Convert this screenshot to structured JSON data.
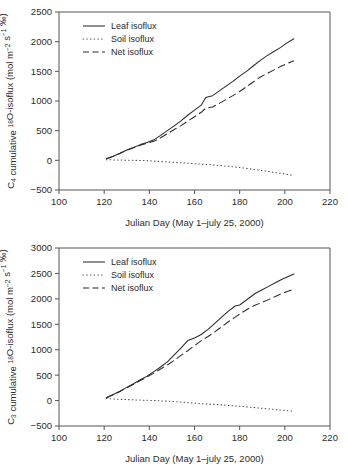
{
  "figure": {
    "panels": [
      "top",
      "bottom"
    ]
  },
  "chart_data": [
    {
      "type": "line",
      "panel": "top",
      "title": "",
      "xlabel": "Julian Day (May 1–july 25, 2000)",
      "ylabel": "C4 cumulative 18O-isoflux (mol m-2 s-1 ‰)",
      "ylabel_parts": {
        "prefix": "C",
        "sub1": "4",
        "mid1": " cumulative ",
        "sup1": "18",
        "mid2": "O-isoflux (mol m",
        "sup2": "−2",
        "mid3": " s",
        "sup3": "−1",
        "suffix": " ‰)"
      },
      "xlim": [
        100,
        220
      ],
      "ylim": [
        -500,
        2500
      ],
      "xticks": [
        100,
        120,
        140,
        160,
        180,
        200,
        220
      ],
      "yticks": [
        -500,
        0,
        500,
        1000,
        1500,
        2000,
        2500
      ],
      "grid": false,
      "legend_position": "top-left",
      "series": [
        {
          "name": "Leaf isoflux",
          "style": "solid",
          "x": [
            121,
            124,
            127,
            130,
            133,
            136,
            139,
            142,
            145,
            148,
            151,
            154,
            157,
            160,
            163,
            165,
            168,
            171,
            174,
            177,
            180,
            183,
            186,
            189,
            192,
            195,
            198,
            201,
            204
          ],
          "y": [
            25,
            70,
            120,
            175,
            215,
            265,
            300,
            345,
            420,
            500,
            580,
            665,
            760,
            845,
            930,
            1060,
            1090,
            1170,
            1250,
            1330,
            1420,
            1500,
            1590,
            1680,
            1760,
            1830,
            1900,
            1980,
            2050
          ]
        },
        {
          "name": "Soil isoflux",
          "style": "dotted",
          "x": [
            121,
            127,
            133,
            139,
            145,
            151,
            157,
            163,
            169,
            175,
            181,
            187,
            193,
            199,
            204
          ],
          "y": [
            10,
            5,
            0,
            -5,
            -20,
            -35,
            -50,
            -65,
            -80,
            -100,
            -125,
            -155,
            -190,
            -225,
            -255
          ]
        },
        {
          "name": "Net isoflux",
          "style": "dashed",
          "x": [
            121,
            124,
            127,
            130,
            133,
            136,
            139,
            142,
            145,
            148,
            151,
            154,
            157,
            160,
            163,
            165,
            168,
            171,
            174,
            177,
            180,
            183,
            186,
            189,
            192,
            195,
            198,
            201,
            204
          ],
          "y": [
            25,
            70,
            115,
            170,
            210,
            255,
            290,
            320,
            380,
            450,
            520,
            585,
            660,
            735,
            810,
            880,
            900,
            960,
            1025,
            1090,
            1160,
            1240,
            1320,
            1400,
            1460,
            1520,
            1580,
            1630,
            1680
          ]
        }
      ]
    },
    {
      "type": "line",
      "panel": "bottom",
      "title": "",
      "xlabel": "Julian Day (May 1–july 25, 2000)",
      "ylabel": "C3 cumulative 18O-isoflux (mol m-2 s-1 ‰)",
      "ylabel_parts": {
        "prefix": "C",
        "sub1": "3",
        "mid1": " cumulative ",
        "sup1": "18",
        "mid2": "O-isoflux (mol m",
        "sup2": "−2",
        "mid3": " s",
        "sup3": "−1",
        "suffix": " ‰)"
      },
      "xlim": [
        100,
        220
      ],
      "ylim": [
        -500,
        3000
      ],
      "xticks": [
        100,
        120,
        140,
        160,
        180,
        200,
        220
      ],
      "yticks": [
        -500,
        0,
        500,
        1000,
        1500,
        2000,
        2500,
        3000
      ],
      "grid": false,
      "legend_position": "top-left",
      "series": [
        {
          "name": "Leaf isoflux",
          "style": "solid",
          "x": [
            121,
            124,
            127,
            130,
            133,
            136,
            139,
            142,
            145,
            148,
            151,
            154,
            157,
            160,
            163,
            166,
            169,
            172,
            175,
            178,
            180,
            187,
            190,
            193,
            196,
            199,
            202,
            204
          ],
          "y": [
            55,
            120,
            185,
            260,
            330,
            410,
            480,
            570,
            660,
            760,
            900,
            1030,
            1180,
            1230,
            1300,
            1400,
            1520,
            1640,
            1760,
            1860,
            1880,
            2110,
            2180,
            2250,
            2320,
            2390,
            2450,
            2490
          ]
        },
        {
          "name": "Soil isoflux",
          "style": "dotted",
          "x": [
            121,
            127,
            133,
            139,
            145,
            151,
            157,
            163,
            169,
            175,
            181,
            187,
            193,
            199,
            204
          ],
          "y": [
            40,
            25,
            15,
            5,
            -5,
            -20,
            -40,
            -60,
            -75,
            -95,
            -115,
            -140,
            -165,
            -190,
            -210
          ]
        },
        {
          "name": "Net isoflux",
          "style": "dashed",
          "x": [
            121,
            124,
            127,
            130,
            133,
            136,
            139,
            142,
            145,
            148,
            151,
            154,
            157,
            160,
            163,
            166,
            169,
            172,
            175,
            178,
            181,
            184,
            187,
            190,
            193,
            196,
            199,
            202,
            204
          ],
          "y": [
            55,
            115,
            180,
            250,
            320,
            395,
            465,
            540,
            620,
            700,
            790,
            890,
            980,
            1080,
            1180,
            1260,
            1350,
            1450,
            1550,
            1640,
            1730,
            1810,
            1880,
            1930,
            1990,
            2050,
            2110,
            2160,
            2190
          ]
        }
      ]
    }
  ]
}
